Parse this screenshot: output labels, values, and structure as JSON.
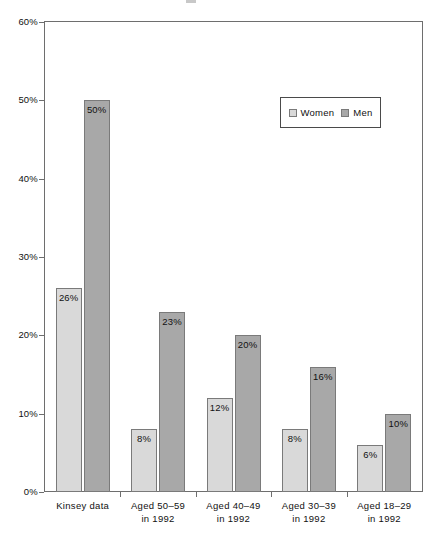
{
  "chart_data": {
    "type": "bar",
    "title": "",
    "xlabel": "",
    "ylabel": "",
    "ylim": [
      0,
      60
    ],
    "y_ticks": [
      "0%",
      "10%",
      "20%",
      "30%",
      "40%",
      "50%",
      "60%"
    ],
    "y_tick_values": [
      0,
      10,
      20,
      30,
      40,
      50,
      60
    ],
    "grid": false,
    "legend_position": "upper right inside plot",
    "categories": [
      "Kinsey data",
      "Aged 50–59 in 1992",
      "Aged 40–49 in 1992",
      "Aged 30–39 in 1992",
      "Aged 18–29 in 1992"
    ],
    "category_lines": [
      {
        "line1": "Kinsey data",
        "line2": ""
      },
      {
        "line1": "Aged 50–59",
        "line2": "in 1992"
      },
      {
        "line1": "Aged 40–49",
        "line2": "in 1992"
      },
      {
        "line1": "Aged 30–39",
        "line2": "in 1992"
      },
      {
        "line1": "Aged 18–29",
        "line2": "in 1992"
      }
    ],
    "series": [
      {
        "name": "Women",
        "color": "#d9d9d9",
        "values": [
          26,
          8,
          12,
          8,
          6
        ],
        "labels": [
          "26%",
          "8%",
          "12%",
          "8%",
          "6%"
        ]
      },
      {
        "name": "Men",
        "color": "#a8a8a8",
        "values": [
          50,
          23,
          20,
          16,
          10
        ],
        "labels": [
          "50%",
          "23%",
          "20%",
          "16%",
          "10%"
        ]
      }
    ]
  },
  "legend": {
    "items": [
      {
        "label": "Women",
        "color": "#d9d9d9"
      },
      {
        "label": "Men",
        "color": "#a8a8a8"
      }
    ]
  },
  "colors": {
    "women_bar": "#d9d9d9",
    "men_bar": "#a8a8a8",
    "bar_border": "#7a7a7a",
    "axis": "#6e6e6e",
    "text": "#111111",
    "background": "#ffffff"
  }
}
